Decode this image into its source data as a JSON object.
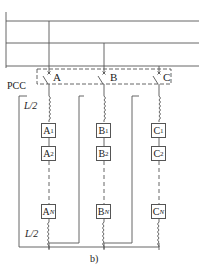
{
  "diagram": {
    "caption": "b)",
    "pcc_label": "PCC",
    "inductor_top_label": "L/2",
    "inductor_bottom_label": "L/2",
    "phases": [
      {
        "name": "A",
        "modules": [
          "A1",
          "A2",
          "AN"
        ],
        "module_base": "A",
        "module_subs": [
          "1",
          "2",
          "N"
        ]
      },
      {
        "name": "B",
        "modules": [
          "B1",
          "B2",
          "BN"
        ],
        "module_base": "B",
        "module_subs": [
          "1",
          "2",
          "N"
        ]
      },
      {
        "name": "C",
        "modules": [
          "C1",
          "C2",
          "CN"
        ],
        "module_base": "C",
        "module_subs": [
          "1",
          "2",
          "N"
        ]
      }
    ],
    "line_color": "#555555"
  }
}
